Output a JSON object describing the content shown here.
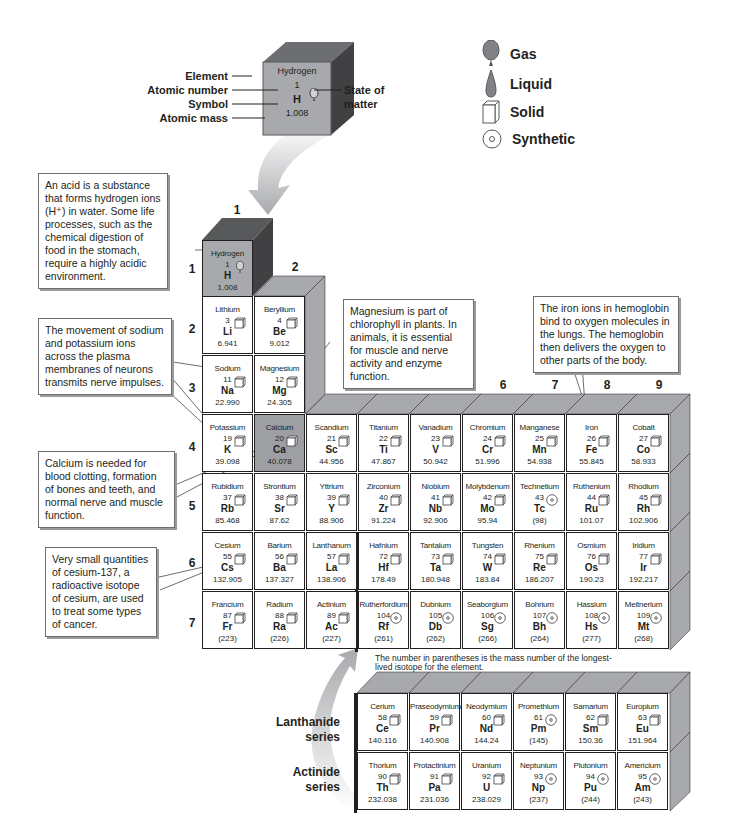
{
  "key": {
    "element": {
      "name": "Hydrogen",
      "number": "1",
      "symbol": "H",
      "mass": "1.008",
      "state": "gas"
    },
    "labels": {
      "element": "Element",
      "atomic_number": "Atomic number",
      "symbol": "Symbol",
      "atomic_mass": "Atomic mass",
      "state_of_matter_1": "State of",
      "state_of_matter_2": "matter"
    }
  },
  "legend": [
    {
      "icon": "gas-balloon-icon",
      "label": "Gas"
    },
    {
      "icon": "liquid-drop-icon",
      "label": "Liquid"
    },
    {
      "icon": "solid-cube-icon",
      "label": "Solid"
    },
    {
      "icon": "synthetic-circle-icon",
      "label": "Synthetic"
    }
  ],
  "group_labels": [
    "1",
    "2",
    "3",
    "4",
    "5",
    "6",
    "7",
    "8",
    "9"
  ],
  "period_labels": [
    "1",
    "2",
    "3",
    "4",
    "5",
    "6",
    "7"
  ],
  "callouts": {
    "hydrogen": "An acid is a substance that forms hydrogen ions (H⁺) in water. Some life processes, such as the chemical digestion of food in the stomach, require a highly acidic environment.",
    "sodium_potassium": "The movement of sodium and potassium ions across the plasma membranes of neurons transmits nerve impulses.",
    "magnesium": "Magnesium is part of chlorophyll in plants. In animals, it is essential for muscle and nerve activity and enzyme function.",
    "iron": "The iron ions in hemoglobin bind to oxygen molecules in the lungs. The hemoglobin then delivers the oxygen to other parts of the body.",
    "calcium": "Calcium is needed for blood clotting, formation of bones and teeth, and normal nerve and muscle function.",
    "cesium": "Very small quantities of cesium-137, a radioactive isotope of cesium, are used to treat some types of cancer."
  },
  "note": "The number in parentheses is the mass number of the longest-lived isotope for the element.",
  "series_labels": {
    "lanthanide": [
      "Lanthanide",
      "series"
    ],
    "actinide": [
      "Actinide",
      "series"
    ]
  },
  "elements": [
    {
      "name": "Hydrogen",
      "number": "1",
      "symbol": "H",
      "mass": "1.008",
      "state": "gas",
      "period": 1,
      "group": 1
    },
    {
      "name": "Lithium",
      "number": "3",
      "symbol": "Li",
      "mass": "6.941",
      "state": "solid",
      "period": 2,
      "group": 1
    },
    {
      "name": "Beryllium",
      "number": "4",
      "symbol": "Be",
      "mass": "9.012",
      "state": "solid",
      "period": 2,
      "group": 2
    },
    {
      "name": "Sodium",
      "number": "11",
      "symbol": "Na",
      "mass": "22.990",
      "state": "solid",
      "period": 3,
      "group": 1
    },
    {
      "name": "Magnesium",
      "number": "12",
      "symbol": "Mg",
      "mass": "24.305",
      "state": "solid",
      "period": 3,
      "group": 2
    },
    {
      "name": "Potassium",
      "number": "19",
      "symbol": "K",
      "mass": "39.098",
      "state": "solid",
      "period": 4,
      "group": 1
    },
    {
      "name": "Calcium",
      "number": "20",
      "symbol": "Ca",
      "mass": "40.078",
      "state": "solid",
      "period": 4,
      "group": 2,
      "highlight": true
    },
    {
      "name": "Scandium",
      "number": "21",
      "symbol": "Sc",
      "mass": "44.956",
      "state": "solid",
      "period": 4,
      "group": 3
    },
    {
      "name": "Titanium",
      "number": "22",
      "symbol": "Ti",
      "mass": "47.867",
      "state": "solid",
      "period": 4,
      "group": 4
    },
    {
      "name": "Vanadium",
      "number": "23",
      "symbol": "V",
      "mass": "50.942",
      "state": "solid",
      "period": 4,
      "group": 5
    },
    {
      "name": "Chromium",
      "number": "24",
      "symbol": "Cr",
      "mass": "51.996",
      "state": "solid",
      "period": 4,
      "group": 6
    },
    {
      "name": "Manganese",
      "number": "25",
      "symbol": "Mn",
      "mass": "54.938",
      "state": "solid",
      "period": 4,
      "group": 7
    },
    {
      "name": "Iron",
      "number": "26",
      "symbol": "Fe",
      "mass": "55.845",
      "state": "solid",
      "period": 4,
      "group": 8
    },
    {
      "name": "Cobalt",
      "number": "27",
      "symbol": "Co",
      "mass": "58.933",
      "state": "solid",
      "period": 4,
      "group": 9
    },
    {
      "name": "Rubidium",
      "number": "37",
      "symbol": "Rb",
      "mass": "85.468",
      "state": "solid",
      "period": 5,
      "group": 1
    },
    {
      "name": "Strontium",
      "number": "38",
      "symbol": "Sr",
      "mass": "87.62",
      "state": "solid",
      "period": 5,
      "group": 2
    },
    {
      "name": "Yttrium",
      "number": "39",
      "symbol": "Y",
      "mass": "88.906",
      "state": "solid",
      "period": 5,
      "group": 3
    },
    {
      "name": "Zirconium",
      "number": "40",
      "symbol": "Zr",
      "mass": "91.224",
      "state": "solid",
      "period": 5,
      "group": 4
    },
    {
      "name": "Niobium",
      "number": "41",
      "symbol": "Nb",
      "mass": "92.906",
      "state": "solid",
      "period": 5,
      "group": 5
    },
    {
      "name": "Molybdenum",
      "number": "42",
      "symbol": "Mo",
      "mass": "95.94",
      "state": "solid",
      "period": 5,
      "group": 6
    },
    {
      "name": "Technetium",
      "number": "43",
      "symbol": "Tc",
      "mass": "(98)",
      "state": "synthetic",
      "period": 5,
      "group": 7
    },
    {
      "name": "Ruthenium",
      "number": "44",
      "symbol": "Ru",
      "mass": "101.07",
      "state": "solid",
      "period": 5,
      "group": 8
    },
    {
      "name": "Rhodium",
      "number": "45",
      "symbol": "Rh",
      "mass": "102.906",
      "state": "solid",
      "period": 5,
      "group": 9
    },
    {
      "name": "Cesium",
      "number": "55",
      "symbol": "Cs",
      "mass": "132.905",
      "state": "solid",
      "period": 6,
      "group": 1
    },
    {
      "name": "Barium",
      "number": "56",
      "symbol": "Ba",
      "mass": "137.327",
      "state": "solid",
      "period": 6,
      "group": 2
    },
    {
      "name": "Lanthanum",
      "number": "57",
      "symbol": "La",
      "mass": "138.906",
      "state": "solid",
      "period": 6,
      "group": 3
    },
    {
      "name": "Hafnium",
      "number": "72",
      "symbol": "Hf",
      "mass": "178.49",
      "state": "solid",
      "period": 6,
      "group": 4
    },
    {
      "name": "Tantalum",
      "number": "73",
      "symbol": "Ta",
      "mass": "180.948",
      "state": "solid",
      "period": 6,
      "group": 5
    },
    {
      "name": "Tungsten",
      "number": "74",
      "symbol": "W",
      "mass": "183.84",
      "state": "solid",
      "period": 6,
      "group": 6
    },
    {
      "name": "Rhenium",
      "number": "75",
      "symbol": "Re",
      "mass": "186.207",
      "state": "solid",
      "period": 6,
      "group": 7
    },
    {
      "name": "Osmium",
      "number": "76",
      "symbol": "Os",
      "mass": "190.23",
      "state": "solid",
      "period": 6,
      "group": 8
    },
    {
      "name": "Iridium",
      "number": "77",
      "symbol": "Ir",
      "mass": "192.217",
      "state": "solid",
      "period": 6,
      "group": 9
    },
    {
      "name": "Francium",
      "number": "87",
      "symbol": "Fr",
      "mass": "(223)",
      "state": "solid",
      "period": 7,
      "group": 1
    },
    {
      "name": "Radium",
      "number": "88",
      "symbol": "Ra",
      "mass": "(226)",
      "state": "solid",
      "period": 7,
      "group": 2
    },
    {
      "name": "Actinium",
      "number": "89",
      "symbol": "Ac",
      "mass": "(227)",
      "state": "solid",
      "period": 7,
      "group": 3
    },
    {
      "name": "Rutherfordium",
      "number": "104",
      "symbol": "Rf",
      "mass": "(261)",
      "state": "synthetic",
      "period": 7,
      "group": 4
    },
    {
      "name": "Dubnium",
      "number": "105",
      "symbol": "Db",
      "mass": "(262)",
      "state": "synthetic",
      "period": 7,
      "group": 5
    },
    {
      "name": "Seaborgium",
      "number": "106",
      "symbol": "Sg",
      "mass": "(266)",
      "state": "synthetic",
      "period": 7,
      "group": 6
    },
    {
      "name": "Bohrium",
      "number": "107",
      "symbol": "Bh",
      "mass": "(264)",
      "state": "synthetic",
      "period": 7,
      "group": 7
    },
    {
      "name": "Hassium",
      "number": "108",
      "symbol": "Hs",
      "mass": "(277)",
      "state": "synthetic",
      "period": 7,
      "group": 8
    },
    {
      "name": "Meitnerium",
      "number": "109",
      "symbol": "Mt",
      "mass": "(268)",
      "state": "synthetic",
      "period": 7,
      "group": 9
    }
  ],
  "lanthanides": [
    {
      "name": "Cerium",
      "number": "58",
      "symbol": "Ce",
      "mass": "140.116",
      "state": "solid"
    },
    {
      "name": "Praseodymium",
      "number": "59",
      "symbol": "Pr",
      "mass": "140.908",
      "state": "solid"
    },
    {
      "name": "Neodymium",
      "number": "60",
      "symbol": "Nd",
      "mass": "144.24",
      "state": "solid"
    },
    {
      "name": "Promethium",
      "number": "61",
      "symbol": "Pm",
      "mass": "(145)",
      "state": "synthetic"
    },
    {
      "name": "Samarium",
      "number": "62",
      "symbol": "Sm",
      "mass": "150.36",
      "state": "solid"
    },
    {
      "name": "Europium",
      "number": "63",
      "symbol": "Eu",
      "mass": "151.964",
      "state": "solid"
    }
  ],
  "actinides": [
    {
      "name": "Thorium",
      "number": "90",
      "symbol": "Th",
      "mass": "232.038",
      "state": "solid"
    },
    {
      "name": "Protactinium",
      "number": "91",
      "symbol": "Pa",
      "mass": "231.036",
      "state": "solid"
    },
    {
      "name": "Uranium",
      "number": "92",
      "symbol": "U",
      "mass": "238.029",
      "state": "solid"
    },
    {
      "name": "Neptunium",
      "number": "93",
      "symbol": "Np",
      "mass": "(237)",
      "state": "synthetic"
    },
    {
      "name": "Plutonium",
      "number": "94",
      "symbol": "Pu",
      "mass": "(244)",
      "state": "synthetic"
    },
    {
      "name": "Americium",
      "number": "95",
      "symbol": "Am",
      "mass": "(243)",
      "state": "synthetic"
    }
  ]
}
